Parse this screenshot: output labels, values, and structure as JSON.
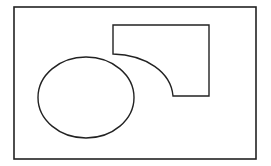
{
  "diagram": {
    "width": 271,
    "height": 166,
    "background": "#ffffff",
    "stroke_color": "#222222",
    "outer_frame": {
      "x": 14,
      "y": 7,
      "width": 242,
      "height": 152
    },
    "ellipse": {
      "cx": 86,
      "cy": 97.5,
      "rx": 48,
      "ry": 40.5
    },
    "curved_shape": {
      "points": {
        "top_left": [
          113,
          25
        ],
        "top_right": [
          209,
          25
        ],
        "bottom_right": [
          209,
          96
        ],
        "curve_end": [
          173,
          96
        ],
        "curve_start": [
          113,
          54
        ]
      }
    }
  }
}
